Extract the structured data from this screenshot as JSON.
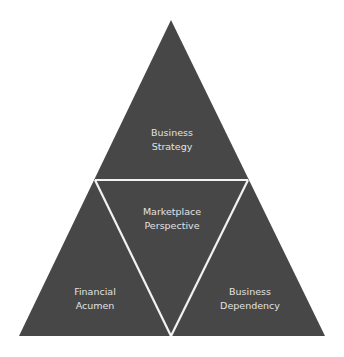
{
  "diagram": {
    "type": "triangle-pyramid",
    "colors": {
      "fill": "#474747",
      "divider": "#f2f2f2",
      "text": "#e2e2e2",
      "background": "#ffffff"
    },
    "sections": [
      {
        "id": "top",
        "line1": "Business",
        "line2": "Strategy"
      },
      {
        "id": "center",
        "line1": "Marketplace",
        "line2": "Perspective"
      },
      {
        "id": "bottom-left",
        "line1": "Financial",
        "line2": "Acumen"
      },
      {
        "id": "bottom-right",
        "line1": "Business",
        "line2": "Dependency"
      }
    ]
  }
}
